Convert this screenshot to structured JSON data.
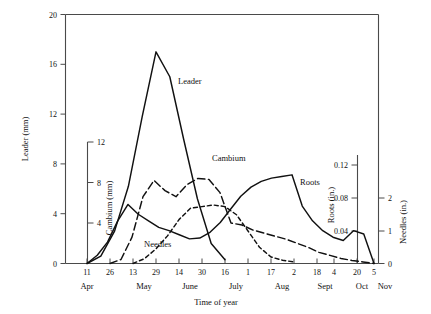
{
  "chart_data": {
    "type": "line",
    "title": "",
    "xlabel": "Time of year",
    "grid": false,
    "legend_position": "inline-annotations",
    "x_tick_labels": [
      "11",
      "26",
      "13",
      "29",
      "14",
      "30",
      "16",
      "1",
      "17",
      "2",
      "18",
      "4",
      "20",
      "5"
    ],
    "x_month_labels": [
      "Apr",
      "May",
      "June",
      "July",
      "Aug",
      "Sept",
      "Oct",
      "Nov"
    ],
    "axes": [
      {
        "name": "Leader (mm)",
        "label": "Leader (mm)",
        "ticks": [
          "0",
          "4",
          "8",
          "12",
          "16",
          "20"
        ],
        "range": [
          0,
          20
        ],
        "side": "left",
        "units": "mm"
      },
      {
        "name": "Cambium (mm)",
        "label": "Cambium (mm)",
        "ticks": [
          "4",
          "8",
          "12"
        ],
        "range": [
          0,
          16
        ],
        "side": "left",
        "units": "mm"
      },
      {
        "name": "Roots (in.)",
        "label": "Roots (in.)",
        "ticks": [
          "0.04",
          "0.08",
          "0.12"
        ],
        "range": [
          0,
          0.2
        ],
        "side": "right",
        "units": "in."
      },
      {
        "name": "Needles (in.)",
        "label": "Needles (in.)",
        "ticks": [
          "0",
          "1",
          "2"
        ],
        "range": [
          0,
          4
        ],
        "side": "right",
        "units": "in."
      }
    ],
    "series": [
      {
        "name": "Leader",
        "label": "Leader",
        "style": "solid",
        "axis": "Leader (mm)",
        "x": [
          "11 Apr",
          "26 Apr",
          "13 May",
          "21 May",
          "29 May",
          "4 June",
          "14 June",
          "22 June",
          "30 June",
          "8 July",
          "16 July"
        ],
        "values": [
          0,
          0.6,
          2.6,
          6.2,
          11.8,
          17.0,
          15.0,
          10.0,
          5.2,
          1.6,
          0.3
        ]
      },
      {
        "name": "Cambium",
        "label": "Cambium",
        "style": "long-dash",
        "axis": "Cambium (mm)",
        "x": [
          "26 Apr",
          "6 May",
          "13 May",
          "21 May",
          "29 May",
          "6 June",
          "14 June",
          "22 June",
          "30 June",
          "8 July",
          "16 July",
          "24 July",
          "1 Aug",
          "9 Aug",
          "17 Aug",
          "25 Aug",
          "2 Sept",
          "10 Sept",
          "18 Sept",
          "26 Sept",
          "4 Oct",
          "12 Oct",
          "20 Oct",
          "28 Oct",
          "5 Nov"
        ],
        "values": [
          0,
          0.4,
          2.6,
          6.6,
          8.2,
          7.2,
          6.6,
          7.8,
          8.4,
          8.3,
          7.0,
          4.0,
          3.8,
          3.3,
          3.0,
          2.7,
          2.4,
          2.0,
          1.6,
          1.1,
          0.8,
          0.5,
          0.3,
          0.15,
          0
        ]
      },
      {
        "name": "Needles",
        "label": "Needles",
        "style": "short-dash",
        "axis": "Needles (in.)",
        "x": [
          "13 May",
          "21 May",
          "29 May",
          "6 June",
          "14 June",
          "22 June",
          "30 June",
          "8 July",
          "16 July",
          "24 July",
          "1 Aug",
          "9 Aug",
          "17 Aug",
          "25 Aug",
          "2 Sept"
        ],
        "values": [
          0,
          0.15,
          0.45,
          0.85,
          1.35,
          1.7,
          1.75,
          1.8,
          1.75,
          1.5,
          1.0,
          0.5,
          0.2,
          0.1,
          0.05
        ]
      },
      {
        "name": "Roots",
        "label": "Roots",
        "style": "solid",
        "axis": "Roots (in.)",
        "x": [
          "11 Apr",
          "26 Apr",
          "13 May",
          "21 May",
          "29 May",
          "6 June",
          "14 June",
          "22 June",
          "30 June",
          "8 July",
          "16 July",
          "24 July",
          "1 Aug",
          "9 Aug",
          "17 Aug",
          "25 Aug",
          "2 Sept",
          "10 Sept",
          "18 Sept",
          "26 Sept",
          "4 Oct",
          "8 Oct",
          "12 Oct",
          "16 Oct",
          "20 Oct",
          "24 Oct",
          "28 Oct",
          "1 Nov",
          "5 Nov"
        ],
        "values": [
          0,
          0.01,
          0.026,
          0.052,
          0.072,
          0.06,
          0.052,
          0.044,
          0.04,
          0.035,
          0.03,
          0.031,
          0.038,
          0.05,
          0.066,
          0.082,
          0.093,
          0.1,
          0.104,
          0.106,
          0.108,
          0.07,
          0.052,
          0.04,
          0.032,
          0.028,
          0.04,
          0.036,
          0.0
        ]
      }
    ],
    "annotations": [
      {
        "text": "Leader",
        "series": "Leader"
      },
      {
        "text": "Cambium",
        "series": "Cambium"
      },
      {
        "text": "Needles",
        "series": "Needles"
      },
      {
        "text": "Roots",
        "series": "Roots"
      }
    ]
  }
}
